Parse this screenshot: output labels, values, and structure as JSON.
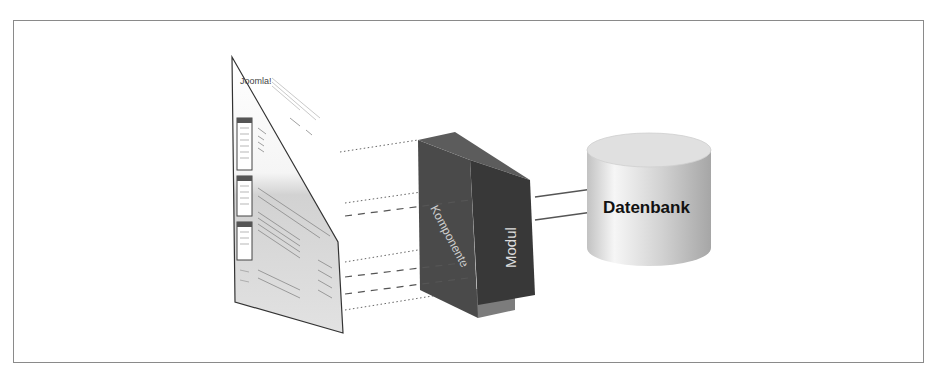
{
  "diagram": {
    "webpage": {
      "logo_text": "Joomla!",
      "description": "Joomla website page shown in perspective"
    },
    "component_block": {
      "front_label": "Komponente",
      "side_label": "Modul"
    },
    "database": {
      "label": "Datenbank"
    },
    "connectors": {
      "dotted_lines": 4,
      "dashed_lines": 3,
      "arrows_to_database": 2
    },
    "colors": {
      "block_front": "#4a4a4a",
      "block_side": "#3a3a3a",
      "block_top": "#5a5a5a",
      "block_lower": "#7a7a7a",
      "database_fill": "#d8d8d8",
      "frame_border": "#8a8a8a",
      "line": "#555555"
    }
  }
}
